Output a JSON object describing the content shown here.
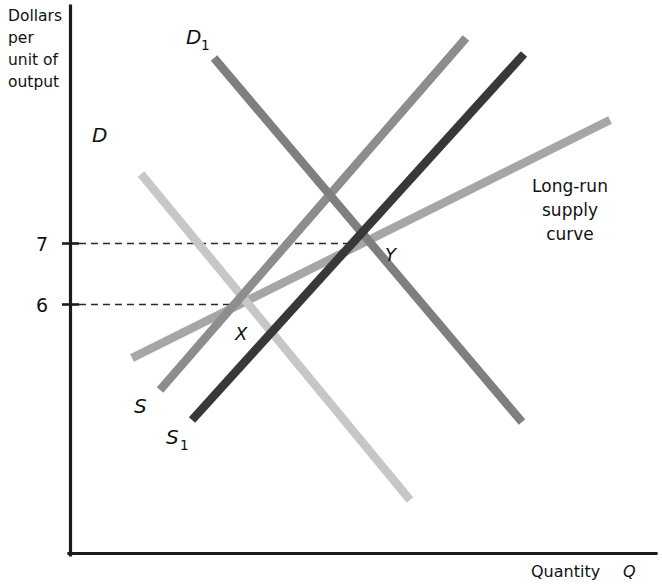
{
  "chart_data": {
    "type": "line",
    "title": "",
    "xlabel": "Quantity Q",
    "ylabel": "Dollars per unit of output",
    "grid": false,
    "legend_position": "inline-labels",
    "y_ticks": [
      "7",
      "6"
    ],
    "y_tick_values": [
      7,
      6
    ],
    "ylim": [
      0,
      10
    ],
    "xlim": [
      0,
      10
    ],
    "annotations": [
      {
        "name": "long-run-supply-note",
        "text": "Long-run supply curve"
      },
      {
        "name": "equilibrium-point-x",
        "text": "X",
        "value_y": 6
      },
      {
        "name": "equilibrium-point-y",
        "text": "Y",
        "value_y": 7
      }
    ],
    "series": [
      {
        "name": "D",
        "label": "D",
        "kind": "demand",
        "color": "#c7c7c7",
        "points": [
          [
            0.55,
            8.15
          ],
          [
            5.14,
            1.05
          ]
        ],
        "px": [
          [
            141,
            174
          ],
          [
            410,
            500
          ]
        ]
      },
      {
        "name": "D1",
        "label": "D",
        "sublabel": "1",
        "kind": "demand-shifted",
        "color": "#7f7f7f",
        "points": [
          [
            1.79,
            9.68
          ],
          [
            5.87,
            2.8
          ]
        ],
        "px": [
          [
            214,
            58
          ],
          [
            522,
            422
          ]
        ]
      },
      {
        "name": "S",
        "label": "S",
        "kind": "supply",
        "color": "#8d8d8d",
        "points": [
          [
            0.83,
            3.14
          ],
          [
            5.45,
            10.08
          ]
        ],
        "px": [
          [
            160,
            390
          ],
          [
            466,
            38
          ]
        ]
      },
      {
        "name": "S1",
        "label": "S",
        "sublabel": "1",
        "kind": "supply-shifted",
        "color": "#383838",
        "points": [
          [
            1.32,
            2.53
          ],
          [
            6.4,
            9.8
          ]
        ],
        "px": [
          [
            192,
            420
          ],
          [
            524,
            54
          ]
        ]
      },
      {
        "name": "long-run-supply",
        "label": "Long-run supply curve",
        "kind": "long-run-supply",
        "color": "#a6a6a6",
        "points": [
          [
            0.4,
            3.65
          ],
          [
            7.85,
            8.4
          ]
        ],
        "px": [
          [
            132,
            358
          ],
          [
            610,
            120
          ]
        ]
      }
    ],
    "intersections": [
      {
        "label": "X",
        "px": [
          248,
          303
        ],
        "price": 6
      },
      {
        "label": "Y",
        "px": [
          363,
          242
        ],
        "price": 7
      }
    ]
  },
  "axes": {
    "y_caption_lines": [
      "Dollars",
      "per",
      "unit of",
      "output"
    ],
    "x_title_text": "Quantity ",
    "x_title_symbol": "Q",
    "tick_7": "7",
    "tick_6": "6"
  },
  "labels": {
    "demand": "D",
    "demand_shifted_base": "D",
    "demand_shifted_sub": "1",
    "supply": "S",
    "supply_shifted_base": "S",
    "supply_shifted_sub": "1",
    "point_x": "X",
    "point_y": "Y"
  },
  "annotation_text": {
    "line1": "Long-run",
    "line2": "supply",
    "line3": "curve"
  },
  "colors": {
    "axis": "#1b1b1b",
    "demand": "#c7c7c7",
    "demand_shifted": "#7f7f7f",
    "supply": "#8d8d8d",
    "supply_shifted": "#383838",
    "long_run_supply": "#a6a6a6",
    "guide": "#2a2a2a",
    "background": "#ffffff"
  }
}
